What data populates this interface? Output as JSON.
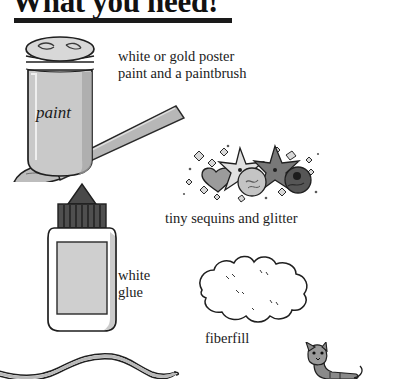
{
  "heading": {
    "title": "What you need!",
    "rule": "horizontal-rule"
  },
  "captions": {
    "paint": "white or gold poster paint and a paintbrush",
    "paint_line1": "white or gold poster",
    "paint_line2": "paint and a paintbrush",
    "sequins": "tiny sequins and glitter",
    "glue_line1": "white",
    "glue_line2": "glue",
    "glue": "white glue",
    "fiberfill": "fiberfill"
  },
  "illustrations": [
    {
      "name": "paint-jar-and-paintbrush",
      "label_on_art": "paint"
    },
    {
      "name": "sequins-and-glitter",
      "label_on_art": ""
    },
    {
      "name": "white-glue-bottle",
      "label_on_art": ""
    },
    {
      "name": "fiberfill-blob",
      "label_on_art": ""
    },
    {
      "name": "wavy-string",
      "label_on_art": ""
    },
    {
      "name": "cat-figure",
      "label_on_art": ""
    }
  ],
  "jar_label": "paint",
  "colors": {
    "ink": "#1b1b1b",
    "rule": "#1a1a1a",
    "paper": "#ffffff",
    "light_gray": "#cfcfcf",
    "mid_gray": "#9c9c9c",
    "dark_gray": "#5a5a5a",
    "darkest_gray": "#3a3a3a"
  }
}
